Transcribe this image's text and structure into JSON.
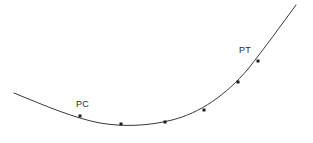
{
  "figure": {
    "name": "horizontal-curve-diagram",
    "background_color": "#ffffff",
    "width": 313,
    "height": 143
  },
  "curve": {
    "stroke_color": "#3a3a3a",
    "stroke_width": 1,
    "description": "smooth concave-up curve rising from lower left to upper right",
    "path": "M 14 93 C 48 107, 74 118, 100 123 C 124 127, 148 126, 172 120 C 200 113, 226 95, 248 69 C 264 49, 282 24, 296 5",
    "start_point": [
      14,
      93
    ],
    "end_point": [
      296,
      5
    ]
  },
  "markers": {
    "fill_color": "#1c1c1c",
    "size": 3,
    "points": [
      {
        "name": "pc-station-marker",
        "x": 80,
        "y": 116,
        "label": "PC"
      },
      {
        "name": "station-marker-1",
        "x": 121,
        "y": 124,
        "label": ""
      },
      {
        "name": "station-marker-2",
        "x": 165,
        "y": 122,
        "label": ""
      },
      {
        "name": "station-marker-3",
        "x": 204,
        "y": 110,
        "label": ""
      },
      {
        "name": "station-marker-4",
        "x": 238,
        "y": 82,
        "label": ""
      },
      {
        "name": "pt-station-marker",
        "x": 258,
        "y": 61,
        "label": "PT"
      }
    ]
  },
  "labels": [
    {
      "name": "pc-label",
      "text": "PC",
      "x": 76,
      "y": 100
    },
    {
      "name": "pt-label",
      "text": "PT",
      "x": 239,
      "y": 46
    }
  ]
}
